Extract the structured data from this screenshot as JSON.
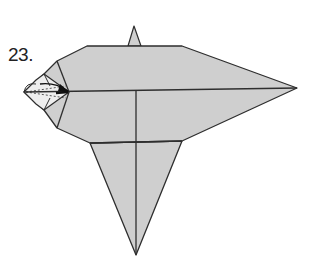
{
  "diagram": {
    "step_number": "23.",
    "colors": {
      "paper_fill": "#cfcfcf",
      "edge_stroke": "#2e2e2e",
      "background": "#ffffff"
    },
    "vertices": {
      "top_spike_tip": [
        134,
        26
      ],
      "top_spike_base_left": [
        128,
        46
      ],
      "top_spike_base_right": [
        141,
        46
      ],
      "body_top_left": [
        87,
        46
      ],
      "body_top_right": [
        182,
        46
      ],
      "body_upper_left": [
        57,
        61
      ],
      "nose_point": [
        69,
        92
      ],
      "body_lower_left": [
        57,
        128
      ],
      "wing_top_left": [
        90,
        143
      ],
      "wing_top_right": [
        182,
        141
      ],
      "right_tip": [
        297,
        88
      ],
      "bottom_tip": [
        136,
        255
      ]
    },
    "fold_lines": [
      {
        "name": "horizontal-center-fold",
        "from": [
          69,
          92
        ],
        "to": [
          297,
          88
        ]
      },
      {
        "name": "vertical-center-fold",
        "from": [
          136,
          91
        ],
        "to": [
          136,
          255
        ]
      },
      {
        "name": "wing-top-crease",
        "from": [
          90,
          143
        ],
        "to": [
          182,
          141
        ]
      }
    ],
    "annotations": [
      {
        "name": "fold-arrow",
        "description": "arrow pointing right into the nose flap"
      },
      {
        "name": "dashed-fold-lines",
        "description": "dotted valley folds on the small nose tip"
      }
    ]
  }
}
